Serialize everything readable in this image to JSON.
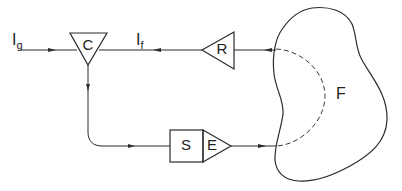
{
  "diagram": {
    "type": "block-diagram",
    "nodes": {
      "C": {
        "label": "C",
        "shape": "inverted-triangle"
      },
      "R": {
        "label": "R",
        "shape": "triangle-left"
      },
      "S": {
        "label": "S",
        "shape": "box"
      },
      "E": {
        "label": "E",
        "shape": "triangle-right"
      },
      "F": {
        "label": "F",
        "shape": "irregular-region"
      }
    },
    "signals": {
      "input": {
        "main": "I",
        "sub": "g"
      },
      "feedback": {
        "main": "I",
        "sub": "f"
      }
    },
    "edges": [
      {
        "from": "input",
        "to": "C",
        "label": "Ig"
      },
      {
        "from": "R",
        "to": "C",
        "label": "If"
      },
      {
        "from": "F",
        "to": "R",
        "style": "dashed-inside-region"
      },
      {
        "from": "C",
        "to": "S"
      },
      {
        "from": "E",
        "to": "F",
        "style": "dashed-inside-region"
      }
    ],
    "colors": {
      "line": "#2a2a2a",
      "background": "#ffffff"
    }
  }
}
